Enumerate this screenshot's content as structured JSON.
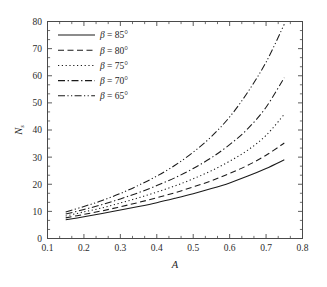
{
  "chart_data": {
    "type": "line",
    "title": "",
    "xlabel": "A",
    "ylabel": "N",
    "ylabel_subscript": "s",
    "xlim": [
      0.1,
      0.8
    ],
    "ylim": [
      0,
      80
    ],
    "xticks": [
      "0.1",
      "0.2",
      "0.3",
      "0.4",
      "0.5",
      "0.6",
      "0.7",
      "0.8"
    ],
    "xtick_values": [
      0.1,
      0.2,
      0.3,
      0.4,
      0.5,
      0.6,
      0.7,
      0.8
    ],
    "yticks": [
      "0",
      "10",
      "20",
      "30",
      "40",
      "50",
      "60",
      "70",
      "80"
    ],
    "ytick_values": [
      0,
      10,
      20,
      30,
      40,
      50,
      60,
      70,
      80
    ],
    "minor_ticks_per_interval": 2,
    "grid": false,
    "legend_position": "top-left",
    "x": [
      0.15,
      0.2,
      0.25,
      0.3,
      0.35,
      0.4,
      0.45,
      0.5,
      0.55,
      0.6,
      0.65,
      0.7,
      0.75
    ],
    "series": [
      {
        "name": "beta = 85",
        "label": "β = 85°",
        "beta": 85,
        "linestyle": "solid",
        "dash": "none",
        "values": [
          6.9,
          8.0,
          9.2,
          10.5,
          11.8,
          13.2,
          14.8,
          16.5,
          18.4,
          20.5,
          23.0,
          25.8,
          29.0
        ]
      },
      {
        "name": "beta = 80",
        "label": "β = 80°",
        "beta": 80,
        "linestyle": "dashed",
        "dash": "6,3.5",
        "values": [
          7.6,
          8.9,
          10.2,
          11.7,
          13.3,
          15.0,
          16.9,
          19.0,
          21.3,
          24.0,
          27.0,
          30.7,
          35.2
        ]
      },
      {
        "name": "beta = 75",
        "label": "β = 75°",
        "beta": 75,
        "linestyle": "dotted",
        "dash": "1.2,2.6",
        "values": [
          8.3,
          9.8,
          11.3,
          13.1,
          15.0,
          17.1,
          19.4,
          22.0,
          25.0,
          28.5,
          32.6,
          38.0,
          45.8
        ]
      },
      {
        "name": "beta = 70",
        "label": "β = 70°",
        "beta": 70,
        "linestyle": "dash-dot",
        "dash": "7,2.6,1.3,2.6",
        "values": [
          9.0,
          10.7,
          12.5,
          14.6,
          16.9,
          19.5,
          22.4,
          25.8,
          29.8,
          34.6,
          40.5,
          48.4,
          59.3
        ]
      },
      {
        "name": "beta = 65",
        "label": "β = 65°",
        "beta": 65,
        "linestyle": "dash-dot-dot",
        "dash": "7,2.4,1.2,2.4,1.2,2.4",
        "values": [
          9.8,
          11.8,
          14.0,
          16.6,
          19.6,
          23.0,
          27.0,
          31.8,
          37.6,
          44.8,
          54.0,
          65.0,
          79.0
        ]
      }
    ]
  },
  "legend": {
    "entries": [
      {
        "symbol": "β",
        "text": " = 85°"
      },
      {
        "symbol": "β",
        "text": " = 80°"
      },
      {
        "symbol": "β",
        "text": " = 75°"
      },
      {
        "symbol": "β",
        "text": " = 70°"
      },
      {
        "symbol": "β",
        "text": " = 65°"
      }
    ]
  }
}
